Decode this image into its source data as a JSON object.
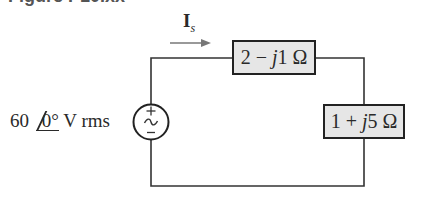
{
  "figure": {
    "header": "Figure P10.xx"
  },
  "current": {
    "symbol": "I",
    "subscript": "s"
  },
  "source": {
    "magnitude": "60",
    "angle": "0°",
    "unit": "V rms",
    "plus": "+",
    "minus": "−",
    "tilde": "~"
  },
  "impedances": [
    {
      "real": "2",
      "op": "−",
      "imag_j": "j",
      "imag": "1",
      "unit": "Ω"
    },
    {
      "real": "1",
      "op": "+",
      "imag_j": "j",
      "imag": "5",
      "unit": "Ω"
    }
  ],
  "colors": {
    "wire": "#333333",
    "box_fill": "#e6e6e6",
    "box_border": "#222222"
  }
}
